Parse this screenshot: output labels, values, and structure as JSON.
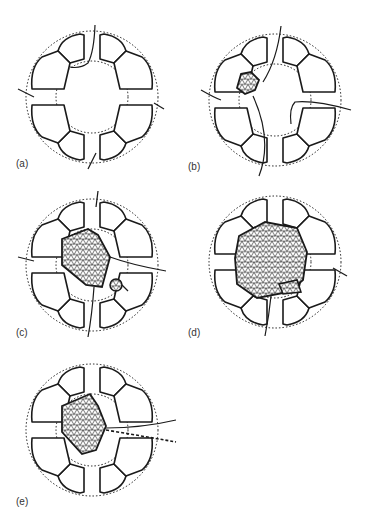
{
  "figure": {
    "panels": [
      {
        "id": "a",
        "label": "(a)",
        "cx": 92,
        "cy": 97,
        "mass": null,
        "small_mass": null
      },
      {
        "id": "b",
        "label": "(b)",
        "cx": 275,
        "cy": 100,
        "mass": "small-upper-left",
        "small_mass": null
      },
      {
        "id": "c",
        "label": "(c)",
        "cx": 92,
        "cy": 265,
        "mass": "medium-center",
        "small_mass": "lower-right"
      },
      {
        "id": "d",
        "label": "(d)",
        "cx": 275,
        "cy": 262,
        "mass": "large-filling",
        "small_mass": "merged-lower-right"
      },
      {
        "id": "e",
        "label": "(e)",
        "cx": 92,
        "cy": 430,
        "mass": "medium-center",
        "small_mass": null
      }
    ],
    "colors": {
      "line": "#1a1a1a",
      "background": "#ffffff",
      "hatch": "#222222"
    }
  }
}
